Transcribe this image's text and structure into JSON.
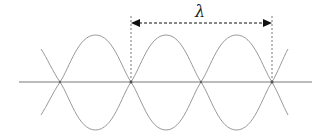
{
  "diagram": {
    "wavelength_label": "λ",
    "colors": {
      "wave": "#9a9a9a",
      "axis": "#7a7a7a",
      "arrow": "#111111",
      "dashed_guides": "#555555"
    },
    "nodes_x": [
      60,
      131,
      201,
      272
    ],
    "axis_y": 82,
    "amplitude_px": 47,
    "arrow": {
      "from_x": 131,
      "to_x": 272,
      "y": 22
    }
  }
}
